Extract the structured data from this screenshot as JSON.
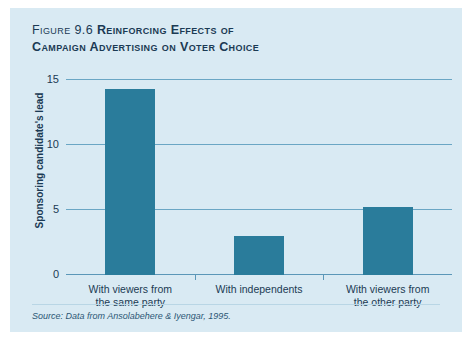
{
  "figure": {
    "number_prefix": "Figure 9.6 ",
    "title": "Reinforcing Effects of Campaign Advertising on Voter Choice",
    "title_line1_prefix": "Figure 9.6 ",
    "title_line1_main": "Reinforcing Effects of",
    "title_line2": "Campaign Advertising on Voter Choice",
    "source": "Source: Data from Ansolabehere & Iyengar, 1995."
  },
  "colors": {
    "panel_background": "#d9eaf3",
    "bar_fill": "#2a7c9b",
    "gridline": "#6aa6c4",
    "text": "#1b3a54"
  },
  "chart_data": {
    "type": "bar",
    "title": "Figure 9.6 Reinforcing Effects of Campaign Advertising on Voter Choice",
    "xlabel": "",
    "ylabel": "Sponsoring candidate's lead",
    "categories": [
      "With viewers from the same party",
      "With independents",
      "With viewers from the other party"
    ],
    "category_lines": [
      [
        "With viewers from",
        "the same party"
      ],
      [
        "With independents",
        ""
      ],
      [
        "With viewers from",
        "the other party"
      ]
    ],
    "values": [
      14.3,
      3.0,
      5.2
    ],
    "ylim": [
      0,
      15.9
    ],
    "yticks": [
      0,
      5,
      10,
      15
    ],
    "ytick_labels": [
      "0",
      "5",
      "10",
      "15"
    ],
    "grid": true,
    "legend": false,
    "source": "Source: Data from Ansolabehere & Iyengar, 1995."
  }
}
